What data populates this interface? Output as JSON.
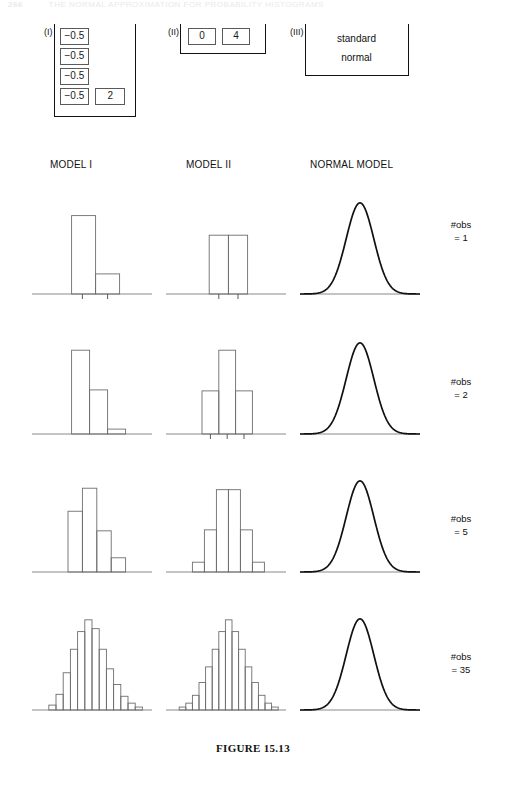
{
  "running_head": {
    "page_number": "266",
    "text": "THE NORMAL APPROXIMATION FOR PROBABILITY HISTOGRAMS"
  },
  "caption": "FIGURE 15.13",
  "box_models": [
    {
      "id": "box-model-1",
      "roman": "(I)",
      "ticket_rows": [
        [
          "−0.5"
        ],
        [
          "−0.5"
        ],
        [
          "−0.5"
        ],
        [
          "−0.5",
          "2"
        ]
      ]
    },
    {
      "id": "box-model-2",
      "roman": "(II)",
      "ticket_rows": [
        [
          "0",
          "4"
        ]
      ]
    },
    {
      "id": "box-model-3",
      "roman": "(III)",
      "lines": [
        "standard",
        "normal"
      ]
    }
  ],
  "column_headings": [
    {
      "key": "model-1",
      "label": "MODEL I"
    },
    {
      "key": "model-2",
      "label": "MODEL II"
    },
    {
      "key": "normal",
      "label": "NORMAL MODEL"
    }
  ],
  "row_labels": [
    {
      "line1": "#obs",
      "line2": "= 1"
    },
    {
      "line1": "#obs",
      "line2": "= 2"
    },
    {
      "line1": "#obs",
      "line2": "= 5"
    },
    {
      "line1": "#obs",
      "line2": "= 35"
    }
  ],
  "chart_data": {
    "type": "bar",
    "title": "FIGURE 15.13",
    "xlabel": "",
    "ylabel": "",
    "grid": false,
    "legend": "none",
    "axis_line": true,
    "panels": [
      {
        "row": 0,
        "row_label": "#obs = 1",
        "column": "MODEL I",
        "type": "bar",
        "bar_count": 2,
        "values": [
          0.8,
          0.205
        ],
        "bar_left_positions": [
          0.33,
          0.53
        ],
        "bar_width": 0.2,
        "ticks": [
          0.42,
          0.63
        ],
        "ylim": [
          0,
          1
        ]
      },
      {
        "row": 0,
        "row_label": "#obs = 1",
        "column": "MODEL II",
        "type": "bar",
        "bar_count": 2,
        "values": [
          0.6,
          0.6
        ],
        "bar_left_positions": [
          0.36,
          0.52
        ],
        "bar_width": 0.16,
        "ticks": [
          0.44,
          0.6
        ],
        "ylim": [
          0,
          1
        ]
      },
      {
        "row": 0,
        "row_label": "#obs = 1",
        "column": "NORMAL MODEL",
        "type": "line",
        "curve": "standard normal",
        "peak": 0.93,
        "mean": 0.5,
        "sd": 0.115
      },
      {
        "row": 1,
        "row_label": "#obs = 2",
        "column": "MODEL I",
        "type": "bar",
        "bar_count": 3,
        "values": [
          0.855,
          0.45,
          0.05
        ],
        "bar_left_positions": [
          0.33,
          0.48,
          0.63
        ],
        "bar_width": 0.15,
        "ticks": [],
        "ylim": [
          0,
          1
        ]
      },
      {
        "row": 1,
        "row_label": "#obs = 2",
        "column": "MODEL II",
        "type": "bar",
        "bar_count": 3,
        "values": [
          0.44,
          0.855,
          0.44
        ],
        "bar_left_positions": [
          0.3,
          0.44,
          0.58
        ],
        "bar_width": 0.14,
        "ticks": [
          0.37,
          0.51,
          0.65
        ],
        "ylim": [
          0,
          1
        ]
      },
      {
        "row": 1,
        "row_label": "#obs = 2",
        "column": "NORMAL MODEL",
        "type": "line",
        "curve": "standard normal",
        "peak": 0.93,
        "mean": 0.5,
        "sd": 0.115
      },
      {
        "row": 2,
        "row_label": "#obs = 5",
        "column": "MODEL I",
        "type": "bar",
        "bar_count": 4,
        "values": [
          0.62,
          0.855,
          0.42,
          0.145
        ],
        "bar_left_positions": [
          0.3,
          0.42,
          0.54,
          0.66
        ],
        "bar_width": 0.12,
        "ticks": [],
        "ylim": [
          0,
          1
        ]
      },
      {
        "row": 2,
        "row_label": "#obs = 5",
        "column": "MODEL II",
        "type": "bar",
        "bar_count": 6,
        "values": [
          0.1,
          0.43,
          0.84,
          0.84,
          0.43,
          0.1
        ],
        "bar_left_positions": [
          0.22,
          0.32,
          0.42,
          0.52,
          0.62,
          0.72
        ],
        "bar_width": 0.1,
        "ticks": [],
        "ylim": [
          0,
          1
        ]
      },
      {
        "row": 2,
        "row_label": "#obs = 5",
        "column": "NORMAL MODEL",
        "type": "line",
        "curve": "standard normal",
        "peak": 0.93,
        "mean": 0.5,
        "sd": 0.115
      },
      {
        "row": 3,
        "row_label": "#obs = 35",
        "column": "MODEL I",
        "type": "bar",
        "bar_count": 13,
        "values": [
          0.05,
          0.16,
          0.38,
          0.62,
          0.8,
          0.92,
          0.83,
          0.62,
          0.42,
          0.26,
          0.14,
          0.07,
          0.03
        ],
        "bar_left_positions": [
          0.14,
          0.2,
          0.26,
          0.32,
          0.38,
          0.44,
          0.5,
          0.56,
          0.62,
          0.68,
          0.74,
          0.8,
          0.86
        ],
        "bar_width": 0.06,
        "ticks": [],
        "ylim": [
          0,
          1
        ]
      },
      {
        "row": 3,
        "row_label": "#obs = 35",
        "column": "MODEL II",
        "type": "bar",
        "bar_count": 15,
        "values": [
          0.03,
          0.07,
          0.15,
          0.28,
          0.44,
          0.62,
          0.8,
          0.92,
          0.8,
          0.62,
          0.44,
          0.28,
          0.15,
          0.07,
          0.03
        ],
        "bar_left_positions": [
          0.11,
          0.165,
          0.22,
          0.275,
          0.33,
          0.385,
          0.44,
          0.495,
          0.55,
          0.605,
          0.66,
          0.715,
          0.77,
          0.825,
          0.88
        ],
        "bar_width": 0.055,
        "ticks": [],
        "ylim": [
          0,
          1
        ]
      },
      {
        "row": 3,
        "row_label": "#obs = 35",
        "column": "NORMAL MODEL",
        "type": "line",
        "curve": "standard normal",
        "peak": 0.93,
        "mean": 0.5,
        "sd": 0.115
      }
    ]
  },
  "layout": {
    "panel_width": 120,
    "panel_height": 112,
    "column_x": [
      32,
      166,
      300
    ],
    "row_y": [
      192,
      332,
      470,
      608
    ],
    "rowlabel_x": 424,
    "rowlabel_y": [
      218,
      375,
      512,
      650
    ],
    "bar_stroke": "#6e6e6e",
    "curve_stroke": "#111111",
    "axis_stroke": "#8a8a8a"
  }
}
